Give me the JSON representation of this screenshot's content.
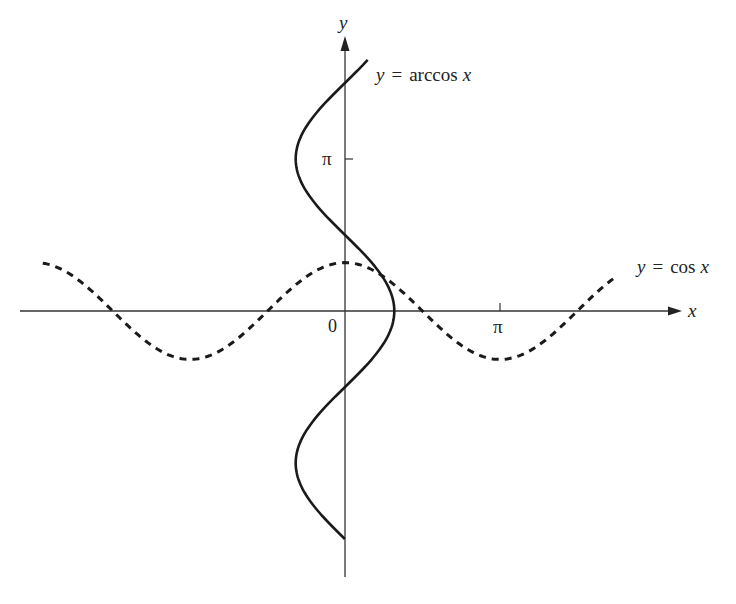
{
  "chart_data": {
    "type": "line",
    "title": "",
    "xlabel": "x",
    "ylabel": "y",
    "origin_label": "0",
    "x_ticks": [
      {
        "value": 3.14159,
        "label": "π"
      }
    ],
    "y_ticks": [
      {
        "value": 3.14159,
        "label": "π"
      }
    ],
    "grid": false,
    "xlim": [
      -6.6,
      7.2
    ],
    "ylim": [
      -5.5,
      5.6
    ],
    "series": [
      {
        "name": "y = cos x",
        "style": "dashed",
        "function": "cos(x)",
        "domain": [
          -6.13,
          5.52
        ],
        "points": [
          [
            -6.13,
            0.99
          ],
          [
            -4.71,
            0
          ],
          [
            -3.14,
            -1
          ],
          [
            -1.57,
            0
          ],
          [
            0,
            1
          ],
          [
            1.57,
            0
          ],
          [
            3.14,
            -1
          ],
          [
            4.71,
            0
          ],
          [
            5.52,
            0.72
          ]
        ]
      },
      {
        "name": "y = arccos x",
        "style": "solid",
        "function": "x = cos(y)",
        "domain_y": [
          -4.71,
          5.19
        ],
        "points": [
          [
            0,
            -4.71
          ],
          [
            -1,
            -3.14
          ],
          [
            0,
            -1.57
          ],
          [
            1,
            0
          ],
          [
            0,
            1.57
          ],
          [
            -1,
            3.14
          ],
          [
            0,
            4.71
          ],
          [
            0.46,
            5.19
          ]
        ]
      }
    ],
    "annotations": [
      {
        "text": "y = arccos x",
        "near": "top end of solid curve"
      },
      {
        "text": "y = cos x",
        "near": "right end of dashed curve"
      }
    ]
  },
  "labels": {
    "x_axis": "x",
    "y_axis": "y",
    "origin": "0",
    "x_pi": "π",
    "y_pi": "π",
    "arccos_label_y": "y",
    "arccos_label_eq": "=",
    "arccos_label_fn": "arccos",
    "arccos_label_x": "x",
    "cos_label_y": "y",
    "cos_label_eq": "=",
    "cos_label_fn": "cos",
    "cos_label_x": "x"
  },
  "colors": {
    "axis": "#333333",
    "curve": "#1a1a1a",
    "background": "#ffffff"
  }
}
